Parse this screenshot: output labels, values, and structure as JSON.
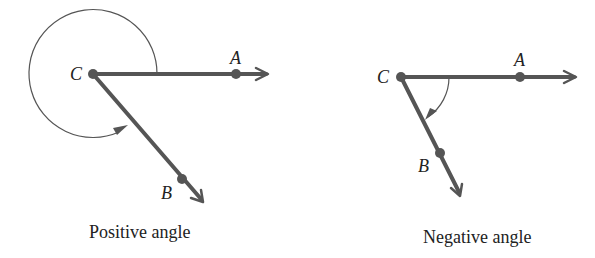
{
  "figures": [
    {
      "id": "positive",
      "caption": "Positive angle",
      "vertex": {
        "label": "C",
        "x": 93,
        "y": 74
      },
      "ray_a": {
        "label": "A",
        "point": {
          "x": 236,
          "y": 74
        },
        "tip": {
          "x": 270,
          "y": 74
        }
      },
      "ray_b": {
        "label": "B",
        "point": {
          "x": 182,
          "y": 179
        },
        "tip": {
          "x": 204,
          "y": 202
        }
      },
      "angle_direction": "counterclockwise (positive), nearly full rotation from CA to CB"
    },
    {
      "id": "negative",
      "caption": "Negative angle",
      "vertex": {
        "label": "C",
        "x": 401,
        "y": 77
      },
      "ray_a": {
        "label": "A",
        "point": {
          "x": 520,
          "y": 77
        },
        "tip": {
          "x": 578,
          "y": 77
        }
      },
      "ray_b": {
        "label": "B",
        "point": {
          "x": 440,
          "y": 153
        },
        "tip": {
          "x": 461,
          "y": 196
        }
      },
      "angle_direction": "clockwise (negative), short rotation from CA to CB"
    }
  ],
  "colors": {
    "line": "#555555",
    "text": "#222222",
    "background": "#ffffff"
  }
}
